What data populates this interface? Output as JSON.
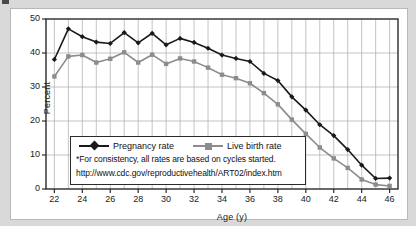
{
  "chart_data": {
    "type": "line",
    "title": "",
    "xlabel": "Age (y)",
    "ylabel": "Percent",
    "xlim": [
      21.4,
      46.6
    ],
    "ylim": [
      0,
      50
    ],
    "xticks": [
      22,
      24,
      26,
      28,
      30,
      32,
      34,
      36,
      38,
      40,
      42,
      44,
      46
    ],
    "yticks": [
      0,
      10,
      20,
      30,
      40,
      50
    ],
    "grid": true,
    "legend_position": "center-left-inside",
    "x": [
      22,
      23,
      24,
      25,
      26,
      27,
      28,
      29,
      30,
      31,
      32,
      33,
      34,
      35,
      36,
      37,
      38,
      39,
      40,
      41,
      42,
      43,
      44,
      45,
      46
    ],
    "series": [
      {
        "name": "Pregnancy rate",
        "color": "#1a1a1a",
        "marker": "diamond",
        "values": [
          38.1,
          47.1,
          44.8,
          43.2,
          42.8,
          46.0,
          43.0,
          45.8,
          42.4,
          44.3,
          43.1,
          41.4,
          39.4,
          38.4,
          37.5,
          34.0,
          31.9,
          27.1,
          23.2,
          18.9,
          15.7,
          11.6,
          7.0,
          3.1,
          3.2
        ]
      },
      {
        "name": "Live birth rate",
        "color": "#8c8c8c",
        "marker": "square",
        "values": [
          33.1,
          39.0,
          39.4,
          37.2,
          38.3,
          40.2,
          37.2,
          39.5,
          36.8,
          38.4,
          37.5,
          35.7,
          33.6,
          32.6,
          31.1,
          28.2,
          24.9,
          20.4,
          16.2,
          12.2,
          9.0,
          6.2,
          2.8,
          1.3,
          0.9
        ]
      }
    ],
    "annotations": [
      "*For consistency, all rates are based on cycles started.",
      "http://www.cdc.gov/reproductivehealth/ART02/index.htm"
    ]
  },
  "figure": {
    "background_color": "#d9d9d9",
    "panel_color": "#ffffff",
    "grid_color": "#aaaaaa",
    "axis_color": "#2b2b2b"
  }
}
